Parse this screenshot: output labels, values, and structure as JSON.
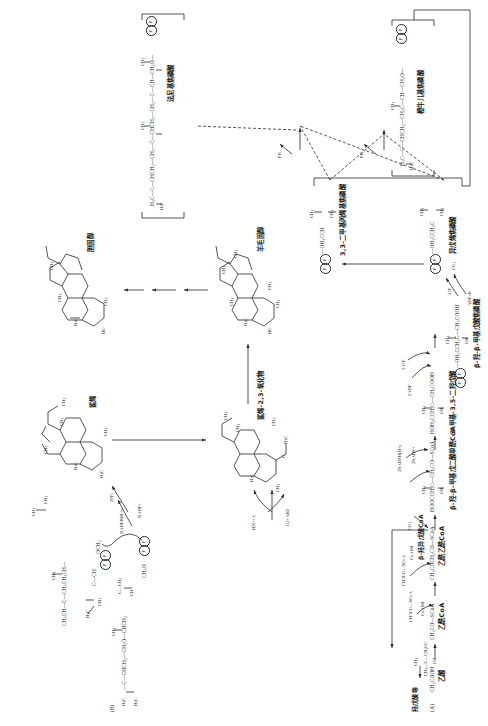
{
  "figure": {
    "title_a": "(A)",
    "title_b": "(B)"
  },
  "panel_a": {
    "substrates": [
      {
        "id": "acetic-acid",
        "formula": "CH3COOH",
        "name_cn": "乙酸"
      },
      {
        "id": "acetyl-coa",
        "formula": "CH3CO—SCoA",
        "name_cn": "乙酰CoA"
      },
      {
        "id": "acetoacetyl-coa",
        "formula": "CH3COCH2CO—SCoA",
        "name_cn": "乙酰乙酰CoA"
      },
      {
        "id": "hmg-coa",
        "formula": "HOOCCH2C—CH2CO—SCoA",
        "name_cn": "β-羟-β-甲基戊二酸单酰CoA"
      },
      {
        "id": "mevalonate",
        "formula": "HOH2CCH2C—CH2COOH",
        "name_cn": "3-甲基-3,5-二羟戊酸"
      },
      {
        "id": "mevalonate-5p",
        "formula": "(P)—OH2CCH2C—CH2COOH",
        "name_cn": "β-羟-β-甲基戊酸焦磷酸"
      },
      {
        "id": "ipp",
        "formula": "(P)(P)—OH2CCH2C",
        "name_cn": "异戊烯焦磷酸"
      },
      {
        "id": "dmapp",
        "formula": "(P)(P)—OH2CCH",
        "name_cn": "3,3-二甲基丙烯基焦磷酸"
      },
      {
        "id": "gpp",
        "formula": "H3C—C—CHCH2—CH2C—CH—CH2O—(P)(P)",
        "name_cn": "橙牛儿基焦磷酸"
      },
      {
        "id": "fpp",
        "formula": "H3C—C—CHCH2—CH2—C—CHCH2—CH2—C—CH—CH2O—(P)(P)",
        "name_cn": "法尼基焦磷酸"
      }
    ],
    "cofactors": [
      {
        "id": "co2",
        "label": "CO2"
      },
      {
        "id": "coash-1",
        "label": "CoASH"
      },
      {
        "id": "coash-2",
        "label": "CoASH"
      },
      {
        "id": "acetyl-coa-in-1",
        "label": "CH3CO—SCoA"
      },
      {
        "id": "acetyl-coa-in-2",
        "label": "CH3CO—SCoA"
      },
      {
        "id": "nadph",
        "label": "2NADPH(H+)"
      },
      {
        "id": "nadp",
        "label": "2NADP+"
      },
      {
        "id": "atp-2",
        "label": "2ATP"
      },
      {
        "id": "adp-2",
        "label": "2ADP"
      },
      {
        "id": "atp-1",
        "label": "ATP"
      },
      {
        "id": "adp-pi",
        "label": "ADP+Pi"
      },
      {
        "id": "ppi-1",
        "label": "PPi"
      },
      {
        "id": "ppi-2",
        "label": "PPi"
      }
    ],
    "top_label": "羟戊酸等",
    "branch_label": "β-羟异戊酸CoA"
  },
  "panel_b": {
    "intermediates": [
      {
        "id": "fpp-b",
        "formula": "H3C—C—CHCH2—CH2O—CHCH2—CH2—C—CH—CH2O(P)(P)",
        "name_cn": ""
      },
      {
        "id": "presqualene",
        "formula": "CH2CH—C—CH2CH2CH—C—CH3",
        "name_cn": ""
      },
      {
        "id": "squalene",
        "name_cn": "鲨烯"
      },
      {
        "id": "squalene-oxide",
        "name_cn": "鲨烯-2,3-氧化物"
      },
      {
        "id": "lanosterol",
        "name_cn": "羊毛固醇"
      },
      {
        "id": "cholesterol",
        "name_cn": "胆固醇"
      }
    ],
    "cofactors": [
      {
        "id": "nadph-b",
        "label": "NADPH(H+)"
      },
      {
        "id": "nadp-b",
        "label": "NADP+"
      },
      {
        "id": "ppi-b",
        "label": "2PPi"
      },
      {
        "id": "o2-ah2",
        "label": "O2+AH2"
      },
      {
        "id": "h2o-a",
        "label": "H2O+A"
      }
    ]
  },
  "colors": {
    "ink": "#2a2a2a",
    "paper": "#ffffff"
  }
}
